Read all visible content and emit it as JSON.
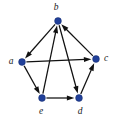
{
  "figure": {
    "background_color": "#ffffff",
    "node_color": "#21409a",
    "edge_color": "#111111",
    "label_color": "#1a1a1a"
  },
  "chart_data": {
    "type": "diagram",
    "diagram_type": "directed-graph",
    "title": "",
    "node_count": 5,
    "edge_count": 8,
    "nodes": [
      {
        "id": "b",
        "label": "b",
        "x": 58,
        "y": 21,
        "label_x": 56,
        "label_y": 8,
        "label_anchor": "middle"
      },
      {
        "id": "a",
        "label": "a",
        "x": 22,
        "y": 62,
        "label_x": 11,
        "label_y": 62,
        "label_anchor": "middle"
      },
      {
        "id": "c",
        "label": "c",
        "x": 96,
        "y": 59,
        "label_x": 106,
        "label_y": 59,
        "label_anchor": "middle"
      },
      {
        "id": "e",
        "label": "e",
        "x": 42,
        "y": 98,
        "label_x": 41,
        "label_y": 112,
        "label_anchor": "middle"
      },
      {
        "id": "d",
        "label": "d",
        "x": 79,
        "y": 98,
        "label_x": 80,
        "label_y": 112,
        "label_anchor": "middle"
      }
    ],
    "edges": [
      {
        "id": "b-a",
        "from": "b",
        "to": "a",
        "directed": true
      },
      {
        "id": "a-c",
        "from": "a",
        "to": "c",
        "directed": true
      },
      {
        "id": "c-b",
        "from": "c",
        "to": "b",
        "directed": true
      },
      {
        "id": "a-e",
        "from": "a",
        "to": "e",
        "directed": true
      },
      {
        "id": "e-d",
        "from": "e",
        "to": "d",
        "directed": true
      },
      {
        "id": "d-c",
        "from": "d",
        "to": "c",
        "directed": true
      },
      {
        "id": "e-b",
        "from": "e",
        "to": "b",
        "directed": true
      },
      {
        "id": "b-d",
        "from": "b",
        "to": "d",
        "directed": true
      }
    ],
    "node_radius": 3.4,
    "arrow_length": 7.5,
    "arrow_width": 5.2
  }
}
